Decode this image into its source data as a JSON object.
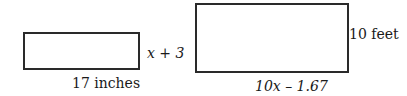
{
  "shapes": [
    {
      "name": "small-rectangle",
      "width_label": "17 inches",
      "height_label": "x + 3"
    },
    {
      "name": "large-rectangle",
      "width_label": "10x – 1.67",
      "height_label": "10 feet"
    }
  ]
}
